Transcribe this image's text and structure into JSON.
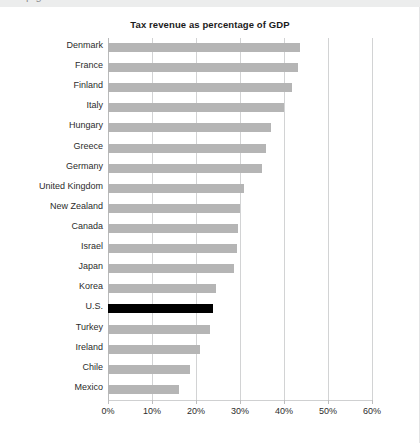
{
  "page": {
    "clipped_top_text": "p g"
  },
  "chart_data": {
    "type": "bar",
    "orientation": "horizontal",
    "title": "Tax revenue as percentage of GDP",
    "xlabel": "",
    "ylabel": "",
    "xlim": [
      0,
      60
    ],
    "grid": true,
    "legend": "none",
    "tick_labels": [
      "0%",
      "10%",
      "20%",
      "30%",
      "40%",
      "50%",
      "60%"
    ],
    "ticks": [
      0,
      10,
      20,
      30,
      40,
      50,
      60
    ],
    "unit": "%",
    "highlight_category": "U.S.",
    "colors": {
      "bar": "#b5b5b5",
      "highlight_bar": "#000000",
      "grid": "#d2d3d4",
      "text": "#2c2c2c",
      "title": "#1b1b1b"
    },
    "categories": [
      "Denmark",
      "France",
      "Finland",
      "Italy",
      "Hungary",
      "Greece",
      "Germany",
      "United Kingdom",
      "New Zealand",
      "Canada",
      "Israel",
      "Japan",
      "Korea",
      "U.S.",
      "Turkey",
      "Ireland",
      "Chile",
      "Mexico"
    ],
    "values": [
      43.6,
      43.2,
      41.8,
      40.0,
      37.0,
      36.0,
      35.0,
      31.0,
      30.0,
      29.5,
      29.3,
      28.6,
      24.5,
      23.9,
      23.2,
      21.0,
      18.6,
      16.1
    ]
  }
}
